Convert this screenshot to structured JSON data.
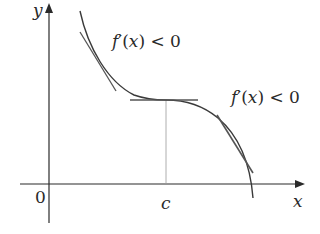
{
  "diagram": {
    "axes": {
      "x_label": "x",
      "y_label": "y",
      "origin_label": "0",
      "point_label": "c"
    },
    "annotations": [
      {
        "id": "left",
        "text_f": "f",
        "text_prime": "′",
        "text_arg": "(x)",
        "text_rel": " < 0"
      },
      {
        "id": "right",
        "text_f": "f",
        "text_prime": "′",
        "text_arg": "(x)",
        "text_rel": " < 0"
      }
    ],
    "colors": {
      "curve": "#3a3a3a",
      "tangent": "#555555",
      "axis": "#2a2a2a",
      "guide": "#9a9a9a"
    }
  }
}
